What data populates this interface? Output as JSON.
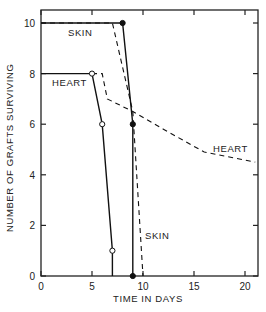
{
  "chart_data": {
    "type": "line",
    "title": "",
    "xlabel": "TIME IN DAYS",
    "ylabel": "NUMBER OF GRAFTS SURVIVING",
    "xlim": [
      0,
      21
    ],
    "ylim": [
      0,
      10.5
    ],
    "xticks": [
      0,
      5,
      10,
      15,
      20
    ],
    "yticks": [
      0,
      2,
      4,
      6,
      8,
      10
    ],
    "grid": false,
    "legend": "inline annotations",
    "series": [
      {
        "name": "SKIN (solid)",
        "style": "solid",
        "marker": "filled-circle",
        "points": [
          [
            0,
            10
          ],
          [
            8,
            10
          ],
          [
            9,
            6
          ],
          [
            9,
            0
          ]
        ]
      },
      {
        "name": "SKIN (dashed)",
        "style": "dashed",
        "marker": "none",
        "points": [
          [
            0,
            10
          ],
          [
            7,
            10
          ],
          [
            9,
            6.5
          ],
          [
            10,
            0
          ]
        ]
      },
      {
        "name": "HEART (solid)",
        "style": "solid",
        "marker": "open-circle",
        "points": [
          [
            0,
            8
          ],
          [
            5,
            8
          ],
          [
            6,
            6
          ],
          [
            7,
            1
          ],
          [
            7,
            0
          ]
        ]
      },
      {
        "name": "HEART (dashed)",
        "style": "dashed",
        "marker": "none",
        "points": [
          [
            5,
            8
          ],
          [
            6,
            8
          ],
          [
            6.5,
            7
          ],
          [
            9,
            6.5
          ],
          [
            12,
            5.8
          ],
          [
            16,
            4.9
          ],
          [
            21,
            4.5
          ]
        ]
      }
    ],
    "annotations": [
      {
        "text": "SKIN",
        "x": 3.5,
        "y": 9.6
      },
      {
        "text": "HEART",
        "x": 2,
        "y": 7.6
      },
      {
        "text": "HEART",
        "x": 17,
        "y": 5.1
      },
      {
        "text": "SKIN",
        "x": 10.3,
        "y": 1.8
      }
    ]
  },
  "labels": {
    "xlabel": "TIME IN DAYS",
    "ylabel": "NUMBER OF GRAFTS SURVIVING",
    "ann_skin_top": "SKIN",
    "ann_heart_left": "HEART",
    "ann_heart_right": "HEART",
    "ann_skin_bottom": "SKIN"
  }
}
